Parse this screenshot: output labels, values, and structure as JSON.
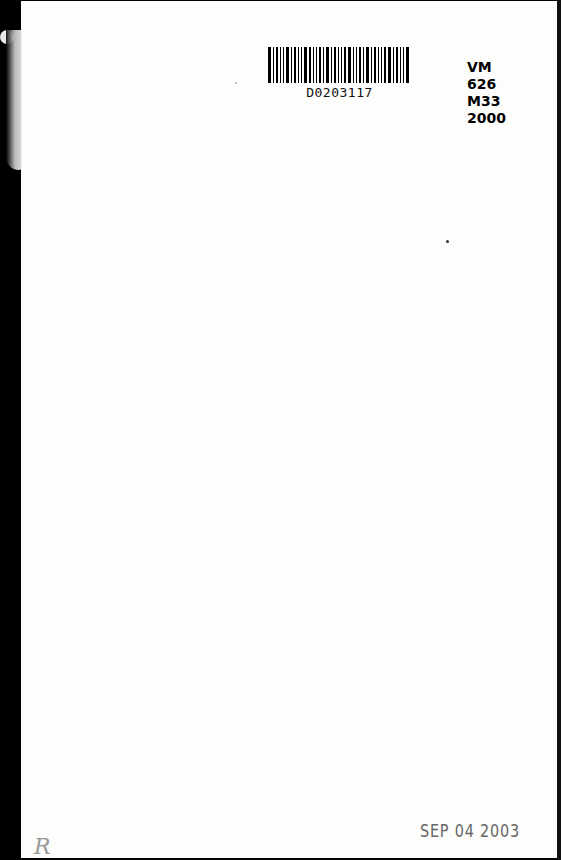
{
  "document": {
    "type": "library book end page",
    "barcode": {
      "label": "D0203117",
      "bars": [
        3,
        1,
        2,
        1,
        1,
        3,
        1,
        2,
        1,
        1,
        3,
        2,
        1,
        1,
        2,
        1,
        3,
        1,
        2,
        1,
        1,
        2,
        3,
        1,
        1,
        2,
        1,
        3,
        1,
        2,
        1,
        1,
        2,
        3,
        1,
        2,
        1,
        1,
        3
      ]
    },
    "call_number": {
      "lines": [
        "VM",
        "626",
        "M33",
        "2000"
      ]
    },
    "date_stamp": "SEP 04 2003",
    "handwritten_mark": "R"
  }
}
